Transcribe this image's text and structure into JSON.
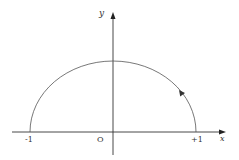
{
  "diagram": {
    "type": "semicircle-contour",
    "axes": {
      "x_label": "x",
      "y_label": "y",
      "origin_label": "O"
    },
    "ticks": {
      "left": "-1",
      "right": "+1"
    },
    "curve": {
      "description": "upper semicircle from -1 to +1",
      "direction": "counterclockwise",
      "arrow_position": "right side of arc, pointing up-left"
    },
    "colors": {
      "line": "#555555",
      "axis": "#333333",
      "background": "#ffffff"
    }
  }
}
